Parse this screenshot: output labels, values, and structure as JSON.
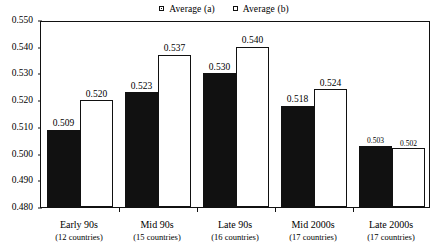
{
  "chart_data": {
    "type": "bar",
    "title": "",
    "subtitle": "",
    "xlabel": "",
    "ylabel": "",
    "ylim": [
      0.48,
      0.55
    ],
    "ytick_labels": [
      "0.550",
      "0.540",
      "0.530",
      "0.520",
      "0.510",
      "0.500",
      "0.490",
      "0.480"
    ],
    "ytick_values": [
      0.55,
      0.54,
      0.53,
      0.52,
      0.51,
      0.5,
      0.49,
      0.48
    ],
    "grid": false,
    "legend_position": "top-center",
    "categories": [
      "Early 90s",
      "Mid 90s",
      "Late 90s",
      "Mid 2000s",
      "Late 2000s"
    ],
    "category_sublabels": [
      "(12 countries)",
      "(15 countries)",
      "(16 countries)",
      "(17 countries)",
      "(17 countries)"
    ],
    "series": [
      {
        "name": "Average (a)",
        "marker": "filled-square",
        "color": "#111111",
        "values": [
          0.509,
          0.523,
          0.53,
          0.518,
          0.503
        ],
        "labels": [
          "0.509",
          "0.523",
          "0.530",
          "0.518",
          "0.503"
        ]
      },
      {
        "name": "Average (b)",
        "marker": "open-square",
        "color": "#ffffff",
        "values": [
          0.52,
          0.537,
          0.54,
          0.524,
          0.502
        ],
        "labels": [
          "0.520",
          "0.537",
          "0.540",
          "0.524",
          "0.502"
        ]
      }
    ]
  },
  "legend": {
    "entries": [
      {
        "label": "Average (a)"
      },
      {
        "label": "Average (b)"
      }
    ]
  },
  "colors": {
    "series_a": "#111111",
    "series_b": "#ffffff",
    "axis": "#111111",
    "background": "#ffffff"
  }
}
